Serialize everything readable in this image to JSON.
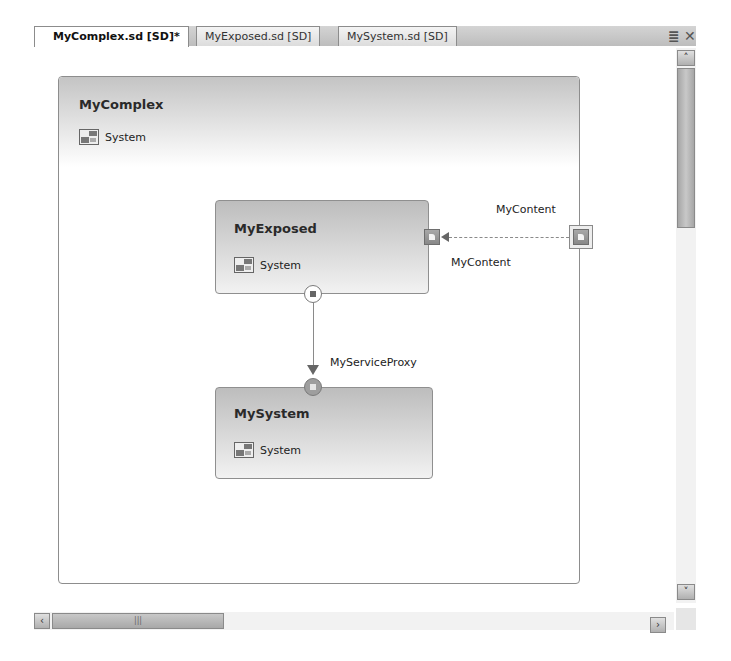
{
  "tabs": [
    {
      "label": "MyComplex.sd [SD]*",
      "active": true
    },
    {
      "label": "MyExposed.sd [SD]",
      "active": false
    },
    {
      "label": "MySystem.sd [SD]",
      "active": false
    }
  ],
  "tabstrip": {
    "dropdown_glyph": "≣",
    "close_glyph": "✕"
  },
  "diagram": {
    "complex": {
      "title": "MyComplex",
      "system_label": "System"
    },
    "exposed": {
      "title": "MyExposed",
      "system_label": "System"
    },
    "system": {
      "title": "MySystem",
      "system_label": "System"
    },
    "connections": {
      "content_outer_label": "MyContent",
      "content_inner_label": "MyContent",
      "proxy_label": "MyServiceProxy"
    }
  },
  "scrollbars": {
    "up_glyph": "˄",
    "down_glyph": "˅",
    "left_glyph": "‹",
    "right_glyph": "›",
    "thumb_grip": "|||"
  },
  "colors": {
    "component_fill_top": "#bdbdbd",
    "border": "#8d8d8d",
    "connector": "#8a8a8a"
  }
}
